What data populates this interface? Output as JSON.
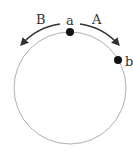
{
  "diagram": {
    "type": "circle-with-points",
    "points": [
      {
        "label": "a",
        "position": "top"
      },
      {
        "label": "b",
        "position": "upper-right"
      }
    ],
    "arrows": [
      {
        "label": "A",
        "direction": "clockwise",
        "from": "a",
        "toward": "b"
      },
      {
        "label": "B",
        "direction": "counterclockwise",
        "from": "a"
      }
    ],
    "colors": {
      "circle": "#b0b0b0",
      "arrow": "#333333",
      "dot": "#111111"
    }
  }
}
